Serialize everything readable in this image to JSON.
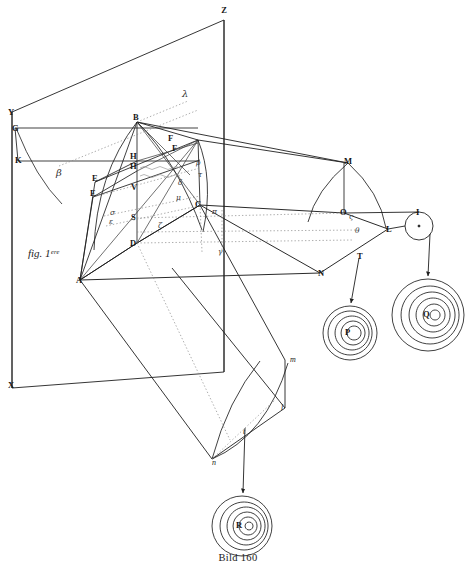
{
  "figure": {
    "caption": "Bild 160",
    "inline_label": "fig. 1ᵉʳᵉ"
  },
  "axis_labels": [
    {
      "id": "Z",
      "text": "Z",
      "x": 224,
      "y": 13
    },
    {
      "id": "Y",
      "text": "Y",
      "x": 8,
      "y": 115
    },
    {
      "id": "X",
      "text": "X",
      "x": 8,
      "y": 388
    }
  ],
  "vertex_labels": [
    {
      "id": "G",
      "text": "G",
      "x": 12,
      "y": 131
    },
    {
      "id": "K",
      "text": "K",
      "x": 15,
      "y": 163
    },
    {
      "id": "B",
      "text": "B",
      "x": 133,
      "y": 120
    },
    {
      "id": "H",
      "text": "H",
      "x": 130,
      "y": 159
    },
    {
      "id": "H2",
      "text": "H",
      "x": 130,
      "y": 169
    },
    {
      "id": "E1",
      "text": "E",
      "x": 92,
      "y": 181
    },
    {
      "id": "E2",
      "text": "E",
      "x": 90,
      "y": 196
    },
    {
      "id": "V",
      "text": "V",
      "x": 131,
      "y": 190
    },
    {
      "id": "S",
      "text": "S",
      "x": 131,
      "y": 220
    },
    {
      "id": "D",
      "text": "D",
      "x": 130,
      "y": 246
    },
    {
      "id": "A",
      "text": "A",
      "x": 76,
      "y": 283
    },
    {
      "id": "C",
      "text": "C",
      "x": 195,
      "y": 207
    },
    {
      "id": "F1",
      "text": "F",
      "x": 168,
      "y": 141
    },
    {
      "id": "F2",
      "text": "F",
      "x": 172,
      "y": 151
    },
    {
      "id": "M",
      "text": "M",
      "x": 344,
      "y": 164
    },
    {
      "id": "O",
      "text": "O",
      "x": 340,
      "y": 215
    },
    {
      "id": "L",
      "text": "L",
      "x": 386,
      "y": 232
    },
    {
      "id": "N",
      "text": "N",
      "x": 318,
      "y": 276
    },
    {
      "id": "T",
      "text": "T",
      "x": 357,
      "y": 259
    },
    {
      "id": "I",
      "text": "I",
      "x": 416,
      "y": 215
    },
    {
      "id": "P",
      "text": "P",
      "x": 345,
      "y": 335
    },
    {
      "id": "Q",
      "text": "Q",
      "x": 423,
      "y": 317
    },
    {
      "id": "R",
      "text": "R",
      "x": 236,
      "y": 528
    }
  ],
  "small_labels": [
    {
      "id": "m",
      "text": "m",
      "x": 290,
      "y": 362
    },
    {
      "id": "l",
      "text": "l",
      "x": 281,
      "y": 410
    },
    {
      "id": "t",
      "text": "t",
      "x": 243,
      "y": 434
    },
    {
      "id": "n",
      "text": "n",
      "x": 212,
      "y": 465
    }
  ],
  "greek_labels": [
    {
      "id": "lambda",
      "text": "λ",
      "x": 182,
      "y": 97
    },
    {
      "id": "beta",
      "text": "β",
      "x": 56,
      "y": 176
    },
    {
      "id": "delta",
      "text": "δ",
      "x": 178,
      "y": 185
    },
    {
      "id": "sigma",
      "text": "σ",
      "x": 110,
      "y": 215
    },
    {
      "id": "epsilon",
      "text": "ε",
      "x": 109,
      "y": 224
    },
    {
      "id": "zeta",
      "text": "ζ",
      "x": 158,
      "y": 228
    },
    {
      "id": "pi",
      "text": "π",
      "x": 212,
      "y": 214
    },
    {
      "id": "gamma",
      "text": "γ",
      "x": 218,
      "y": 254
    },
    {
      "id": "theta",
      "text": "θ",
      "x": 355,
      "y": 233
    },
    {
      "id": "mu",
      "text": "μ",
      "x": 176,
      "y": 200
    },
    {
      "id": "rho",
      "text": "ρ",
      "x": 196,
      "y": 165
    },
    {
      "id": "tau",
      "text": "τ",
      "x": 198,
      "y": 177
    },
    {
      "id": "omicron-sub",
      "text": "ς",
      "x": 349,
      "y": 219
    }
  ],
  "wave_targets": [
    {
      "id": "P",
      "label": "P",
      "cx": 350,
      "cy": 333,
      "r_outer": 27,
      "rings": 5
    },
    {
      "id": "Q",
      "label": "Q",
      "cx": 428,
      "cy": 315,
      "r_outer": 36,
      "rings": 5
    },
    {
      "id": "R",
      "label": "R",
      "cx": 242,
      "cy": 526,
      "r_outer": 30,
      "rings": 5
    },
    {
      "id": "I",
      "label": "I",
      "cx": 419,
      "cy": 226,
      "r_outer": 14,
      "rings": 0
    }
  ],
  "arrows": [
    {
      "id": "T-to-P",
      "from": "T",
      "x1": 359,
      "y1": 258,
      "x2": 351,
      "y2": 306
    },
    {
      "id": "I-to-Q",
      "from": "I",
      "x1": 430,
      "y1": 233,
      "x2": 428,
      "y2": 280
    },
    {
      "id": "t-to-R",
      "from": "t",
      "x1": 245,
      "y1": 428,
      "x2": 243,
      "y2": 497
    }
  ],
  "colors": {
    "line": "#1f1f1f",
    "thin_line": "#444444",
    "dotted_line": "#7a7a7a",
    "background": "#ffffff",
    "label": "#161616"
  }
}
